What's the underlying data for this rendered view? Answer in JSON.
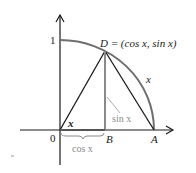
{
  "diagram": {
    "type": "unit-circle-quadrant",
    "labels": {
      "y_tick_one": "1",
      "origin": "0",
      "point_D": "D = (cos x, sin x)",
      "point_B": "B",
      "point_A": "A",
      "arc_label": "x",
      "angle_label": "x",
      "sin_label": "sin x",
      "cos_label": "cos x"
    },
    "colors": {
      "axes": "#1a1a1a",
      "arc": "#6e6e6e",
      "triangle": "#1a1a1a",
      "sin_segment": "#8a8a8a",
      "annotation": "#8a8a8a"
    }
  }
}
